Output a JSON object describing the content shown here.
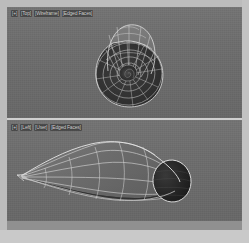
{
  "app": {
    "kind": "3d-modeling-viewport",
    "background_color": "#6d6d6d",
    "frame_color": "#bcbcbc",
    "wire_color": "#d9d9d9",
    "shaded_color": "#303030"
  },
  "viewports": [
    {
      "id": "top",
      "label_segments": [
        "[+]",
        "[Top]",
        "[Wireframe]",
        "[Edged Faces]"
      ],
      "label_text": "[+] [Top] [Wireframe] [Edged Faces]",
      "object_name": "radial-shell-mesh",
      "object_description": "Concentric radial spiral shell, shaded front faces with wireframe back faces"
    },
    {
      "id": "bottom",
      "label_segments": [
        "[+]",
        "[Left]",
        "[User]",
        "[Edged Faces]"
      ],
      "label_text": "[+] [Left] [User] [Edged Faces]",
      "object_name": "tapered-cone-mesh",
      "object_description": "Tapered teardrop / horn form pointing left with open dark elliptical aperture at right"
    }
  ]
}
